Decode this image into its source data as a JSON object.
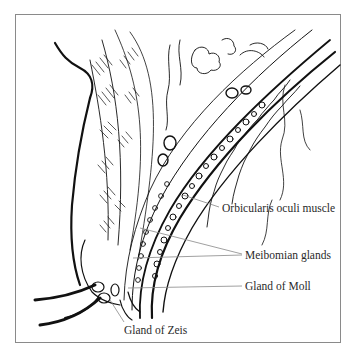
{
  "figure": {
    "labels": [
      {
        "id": "orbicularis",
        "text": "Orbicularis oculi muscle",
        "x": 222,
        "y": 203
      },
      {
        "id": "meibomian",
        "text": "Meibomian glands",
        "x": 245,
        "y": 250
      },
      {
        "id": "moll",
        "text": "Gland of Moll",
        "x": 245,
        "y": 281
      },
      {
        "id": "zeis",
        "text": "Gland of Zeis",
        "x": 124,
        "y": 325
      }
    ]
  },
  "colors": {
    "ink": "#111111",
    "leader": "#888888",
    "frame": "#8a8a8a",
    "background": "#ffffff"
  }
}
